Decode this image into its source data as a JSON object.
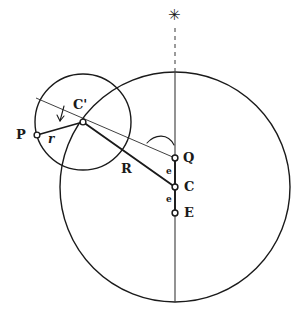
{
  "figure": {
    "kind": "geometric-astronomical-diagram",
    "background_color": "#ffffff",
    "ink_color": "#1a1a1a"
  },
  "labels": {
    "star": {
      "text": "✳",
      "name": "star-marker",
      "x": 168,
      "y": 8
    },
    "c_prime": {
      "text": "C'",
      "x": 73,
      "y": 98
    },
    "p": {
      "text": "P",
      "x": 16,
      "y": 128
    },
    "r_small": {
      "text": "r",
      "x": 48,
      "y": 131
    },
    "r_big": {
      "text": "R",
      "x": 121,
      "y": 162
    },
    "q": {
      "text": "Q",
      "x": 183,
      "y": 150
    },
    "c": {
      "text": "C",
      "x": 184,
      "y": 179
    },
    "e_upper": {
      "text": "e",
      "x": 166,
      "y": 167
    },
    "e_lower": {
      "text": "e",
      "x": 166,
      "y": 195
    },
    "e_point": {
      "text": "E",
      "x": 184,
      "y": 205
    }
  },
  "points": [
    {
      "id": "P",
      "name": "point-p",
      "x": 37,
      "y": 135,
      "marker": "open-circle"
    },
    {
      "id": "C'",
      "name": "point-c-prime",
      "x": 83,
      "y": 122,
      "marker": "open-circle"
    },
    {
      "id": "Q",
      "name": "point-q-equant",
      "x": 175,
      "y": 158,
      "marker": "open-circle"
    },
    {
      "id": "C",
      "name": "point-c-center",
      "x": 175,
      "y": 187,
      "marker": "open-circle"
    },
    {
      "id": "E",
      "name": "point-e-earth",
      "x": 175,
      "y": 213,
      "marker": "open-circle"
    }
  ],
  "circles": [
    {
      "id": "deferent",
      "name": "deferent-circle",
      "cx": 175,
      "cy": 187,
      "r": 115,
      "stroke_width": 1.4
    },
    {
      "id": "epicycle",
      "name": "epicycle-circle",
      "cx": 83,
      "cy": 122,
      "r": 48,
      "stroke_width": 1.4
    }
  ],
  "lines": {
    "axis_solid": {
      "name": "apsidal-line-solid",
      "x1": 175,
      "y1": 72,
      "x2": 175,
      "y2": 302,
      "stroke_width": 1.1
    },
    "axis_dashed": {
      "name": "apsidal-line-dashed",
      "x1": 175,
      "y1": 28,
      "x2": 175,
      "y2": 72,
      "stroke_width": 1.1,
      "dash": "4 4"
    },
    "thin_through_cprime": {
      "name": "epicycle-apse-line",
      "x1": 36,
      "y1": 98,
      "x2": 175,
      "y2": 158,
      "stroke_width": 0.9
    },
    "radius_r": {
      "name": "epicycle-radius-r",
      "x1": 83,
      "y1": 122,
      "x2": 37,
      "y2": 135,
      "stroke_width": 1.6
    },
    "radius_R": {
      "name": "deferent-radius-R",
      "x1": 83,
      "y1": 122,
      "x2": 175,
      "y2": 187,
      "stroke_width": 1.8
    },
    "segment_QC": {
      "name": "segment-q-to-c",
      "x1": 175,
      "y1": 158,
      "x2": 175,
      "y2": 187,
      "stroke_width": 1.8
    },
    "segment_CE": {
      "name": "segment-c-to-e",
      "x1": 175,
      "y1": 187,
      "x2": 175,
      "y2": 213,
      "stroke_width": 1.8
    }
  },
  "arcs": {
    "angle_at_q": {
      "name": "angle-arc-at-q",
      "path": "M 149 141 C 157 135 169 134 174 144",
      "stroke_width": 1.1
    },
    "angle_arrow_cprime": {
      "name": "angle-arrow-at-c-prime",
      "path": "M 66 107 L 62 122",
      "stroke_width": 1.1
    }
  }
}
